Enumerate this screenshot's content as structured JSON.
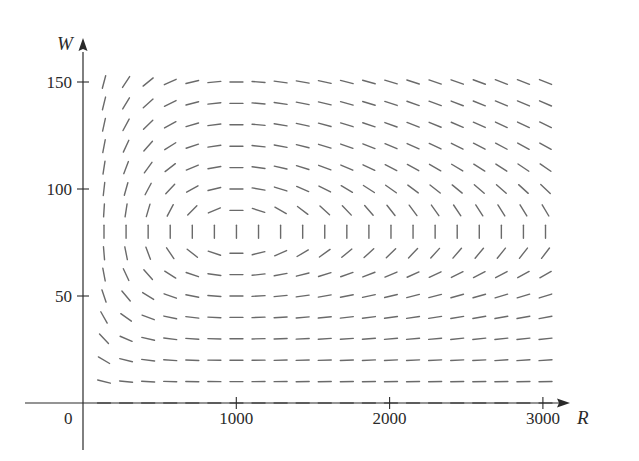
{
  "chart_data": {
    "type": "direction_field",
    "title": "",
    "xlabel": "R",
    "ylabel": "W",
    "xlim": [
      0,
      3150
    ],
    "ylim": [
      0,
      160
    ],
    "origin_label": "0",
    "x_ticks": [
      1000,
      2000,
      3000
    ],
    "x_tick_labels": [
      "1000",
      "2000",
      "3000"
    ],
    "y_ticks": [
      50,
      100,
      150
    ],
    "y_tick_labels": [
      "50",
      "100",
      "150"
    ],
    "grid": false,
    "legend": null,
    "system": {
      "dR_dt": "0.08R - 0.001RW",
      "dW_dt": "-0.02W + 0.00002RW",
      "equilibrium": {
        "R": 1000,
        "W": 80
      }
    },
    "field_grid": {
      "R_start": 137,
      "R_step": 144,
      "R_count": 21,
      "W_start": 0,
      "W_step": 10,
      "W_count": 16
    },
    "segment_color": "#6a6a6a",
    "axis_color": "#2a2a2a"
  }
}
